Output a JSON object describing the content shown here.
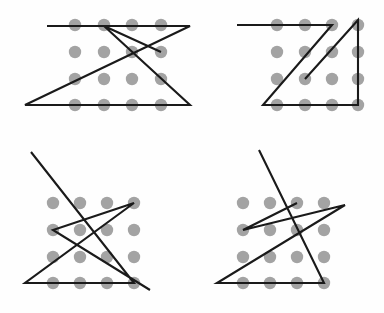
{
  "figure": {
    "background_color": "#fefefe",
    "dot_color": "#a3a3a3",
    "line_color": "#1a1a1a",
    "dot_radius": 6.2,
    "line_width": 2.1,
    "canvas": {
      "width": 384,
      "height": 313
    },
    "panel_count": 4
  },
  "panels": [
    {
      "id": "panel-top-left",
      "label": "Top left puzzle",
      "position": "top-left",
      "grid": {
        "columns": 4,
        "rows": 4,
        "x": [
          75,
          104,
          132,
          161
        ],
        "y": [
          25,
          52,
          79,
          105
        ]
      },
      "dot_count": 16,
      "line_count": 5,
      "polyline": [
        [
          47,
          26
        ],
        [
          190,
          26
        ],
        [
          25,
          105
        ],
        [
          190,
          105
        ],
        [
          104,
          26
        ],
        [
          161,
          52
        ]
      ]
    },
    {
      "id": "panel-top-right",
      "label": "Top right puzzle",
      "position": "top-right",
      "grid": {
        "columns": 4,
        "rows": 4,
        "x": [
          277,
          305,
          332,
          358
        ],
        "y": [
          25,
          52,
          79,
          105
        ]
      },
      "dot_count": 16,
      "line_count": 5,
      "polyline": [
        [
          237,
          25
        ],
        [
          332,
          25
        ],
        [
          263,
          105
        ],
        [
          358,
          105
        ],
        [
          358,
          20
        ],
        [
          305,
          79
        ]
      ]
    },
    {
      "id": "panel-bottom-left",
      "label": "Bottom left puzzle",
      "position": "bottom-left",
      "grid": {
        "columns": 4,
        "rows": 4,
        "x": [
          53,
          80,
          107,
          134
        ],
        "y": [
          203,
          230,
          257,
          283
        ]
      },
      "dot_count": 16,
      "line_count": 5,
      "polyline": [
        [
          31,
          152
        ],
        [
          134,
          283
        ],
        [
          25,
          283
        ],
        [
          134,
          203
        ],
        [
          53,
          230
        ],
        [
          150,
          290
        ]
      ]
    },
    {
      "id": "panel-bottom-right",
      "label": "Bottom right puzzle",
      "position": "bottom-right",
      "grid": {
        "columns": 4,
        "rows": 4,
        "x": [
          243,
          270,
          297,
          324
        ],
        "y": [
          203,
          230,
          257,
          283
        ]
      },
      "dot_count": 16,
      "line_count": 5,
      "polyline": [
        [
          259,
          150
        ],
        [
          324,
          283
        ],
        [
          217,
          283
        ],
        [
          345,
          205
        ],
        [
          243,
          230
        ],
        [
          297,
          203
        ]
      ]
    }
  ]
}
